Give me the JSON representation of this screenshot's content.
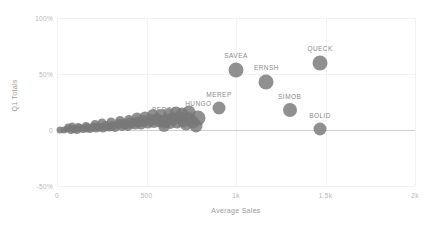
{
  "chart_data": {
    "type": "scatter",
    "title": "",
    "xlabel": "Average Sales",
    "ylabel": "Q1 Totals",
    "xlim": [
      0,
      2000
    ],
    "ylim": [
      -50,
      100
    ],
    "grid": true,
    "legend": "none",
    "x_ticks": [
      {
        "value": 0,
        "label": "0"
      },
      {
        "value": 500,
        "label": "500"
      },
      {
        "value": 1000,
        "label": "1k"
      },
      {
        "value": 1500,
        "label": "1.5k"
      },
      {
        "value": 2000,
        "label": "2k"
      }
    ],
    "y_ticks": [
      {
        "value": 100,
        "label": "100%"
      },
      {
        "value": 50,
        "label": "50%"
      },
      {
        "value": 0,
        "label": "0"
      },
      {
        "value": -50,
        "label": "-50%"
      }
    ],
    "marker_color": "#787878",
    "labeled_points": [
      {
        "name": "BERGS",
        "x": 600,
        "y": 7,
        "size": 13
      },
      {
        "name": "HUNGO",
        "x": 790,
        "y": 11,
        "size": 15
      },
      {
        "name": "MEREP",
        "x": 905,
        "y": 20,
        "size": 13
      },
      {
        "name": "SAVEA",
        "x": 1000,
        "y": 54,
        "size": 15
      },
      {
        "name": "ERNSH",
        "x": 1170,
        "y": 43,
        "size": 15
      },
      {
        "name": "SIMOB",
        "x": 1300,
        "y": 18,
        "size": 14
      },
      {
        "name": "QUECK",
        "x": 1470,
        "y": 60,
        "size": 15
      },
      {
        "name": "BOLID",
        "x": 1470,
        "y": 1,
        "size": 13
      }
    ],
    "cluster_points": [
      {
        "x": 18,
        "y": 0,
        "size": 7
      },
      {
        "x": 40,
        "y": 0,
        "size": 7
      },
      {
        "x": 58,
        "y": 1,
        "size": 7
      },
      {
        "x": 76,
        "y": 0,
        "size": 8
      },
      {
        "x": 95,
        "y": 1,
        "size": 8
      },
      {
        "x": 112,
        "y": 0,
        "size": 8
      },
      {
        "x": 130,
        "y": 2,
        "size": 8
      },
      {
        "x": 148,
        "y": 1,
        "size": 8
      },
      {
        "x": 165,
        "y": 2,
        "size": 9
      },
      {
        "x": 182,
        "y": 1,
        "size": 8
      },
      {
        "x": 200,
        "y": 3,
        "size": 9
      },
      {
        "x": 218,
        "y": 2,
        "size": 9
      },
      {
        "x": 236,
        "y": 3,
        "size": 9
      },
      {
        "x": 255,
        "y": 2,
        "size": 9
      },
      {
        "x": 272,
        "y": 4,
        "size": 10
      },
      {
        "x": 290,
        "y": 3,
        "size": 9
      },
      {
        "x": 308,
        "y": 4,
        "size": 10
      },
      {
        "x": 326,
        "y": 3,
        "size": 10
      },
      {
        "x": 344,
        "y": 5,
        "size": 10
      },
      {
        "x": 362,
        "y": 4,
        "size": 10
      },
      {
        "x": 380,
        "y": 5,
        "size": 11
      },
      {
        "x": 398,
        "y": 4,
        "size": 10
      },
      {
        "x": 416,
        "y": 6,
        "size": 11
      },
      {
        "x": 434,
        "y": 5,
        "size": 11
      },
      {
        "x": 452,
        "y": 7,
        "size": 11
      },
      {
        "x": 470,
        "y": 5,
        "size": 11
      },
      {
        "x": 488,
        "y": 8,
        "size": 12
      },
      {
        "x": 506,
        "y": 6,
        "size": 11
      },
      {
        "x": 524,
        "y": 9,
        "size": 12
      },
      {
        "x": 542,
        "y": 7,
        "size": 12
      },
      {
        "x": 560,
        "y": 10,
        "size": 12
      },
      {
        "x": 578,
        "y": 8,
        "size": 12
      },
      {
        "x": 596,
        "y": 4,
        "size": 12
      },
      {
        "x": 614,
        "y": 9,
        "size": 13
      },
      {
        "x": 632,
        "y": 6,
        "size": 12
      },
      {
        "x": 650,
        "y": 10,
        "size": 13
      },
      {
        "x": 668,
        "y": 7,
        "size": 13
      },
      {
        "x": 686,
        "y": 11,
        "size": 13
      },
      {
        "x": 704,
        "y": 8,
        "size": 13
      },
      {
        "x": 722,
        "y": 5,
        "size": 13
      },
      {
        "x": 740,
        "y": 10,
        "size": 14
      },
      {
        "x": 758,
        "y": 7,
        "size": 13
      },
      {
        "x": 775,
        "y": 4,
        "size": 13
      },
      {
        "x": 252,
        "y": 6,
        "size": 9
      },
      {
        "x": 300,
        "y": 7,
        "size": 9
      },
      {
        "x": 350,
        "y": 8,
        "size": 10
      },
      {
        "x": 400,
        "y": 9,
        "size": 10
      },
      {
        "x": 445,
        "y": 11,
        "size": 11
      },
      {
        "x": 490,
        "y": 12,
        "size": 11
      },
      {
        "x": 535,
        "y": 13,
        "size": 12
      },
      {
        "x": 580,
        "y": 13,
        "size": 12
      },
      {
        "x": 625,
        "y": 14,
        "size": 12
      },
      {
        "x": 665,
        "y": 15,
        "size": 13
      },
      {
        "x": 700,
        "y": 14,
        "size": 13
      },
      {
        "x": 735,
        "y": 16,
        "size": 13
      },
      {
        "x": 160,
        "y": 4,
        "size": 8
      },
      {
        "x": 210,
        "y": 5,
        "size": 8
      },
      {
        "x": 120,
        "y": 3,
        "size": 8
      },
      {
        "x": 60,
        "y": 3,
        "size": 7
      },
      {
        "x": 85,
        "y": 4,
        "size": 7
      }
    ]
  }
}
